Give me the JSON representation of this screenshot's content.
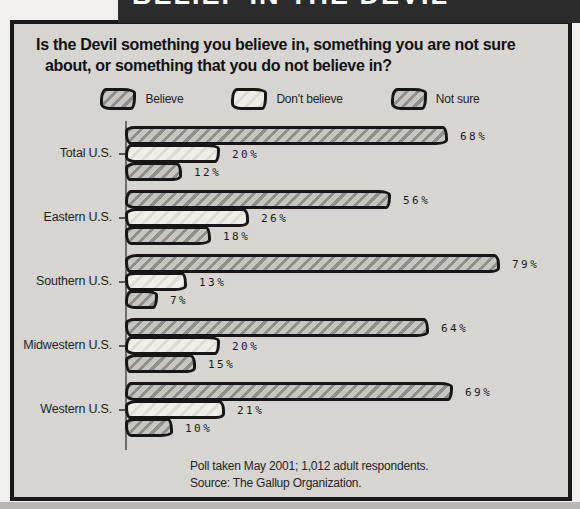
{
  "banner": {
    "title": "BELIEF IN THE DEVIL"
  },
  "question": {
    "line1": "Is the Devil something you believe in, something you are not sure",
    "line2": "about, or something that you do not believe in?"
  },
  "legend": {
    "items": [
      {
        "label": "Believe",
        "swatch": "hatch-dark"
      },
      {
        "label": "Don't believe",
        "swatch": "hatch-light"
      },
      {
        "label": "Not sure",
        "swatch": "hatch-dark"
      }
    ]
  },
  "chart_data": {
    "type": "bar",
    "orientation": "horizontal",
    "title": "BELIEF IN THE DEVIL",
    "categories": [
      "Total U.S.",
      "Eastern U.S.",
      "Southern U.S.",
      "Midwestern U.S.",
      "Western U.S."
    ],
    "series": [
      {
        "name": "Believe",
        "values": [
          68,
          56,
          79,
          64,
          69
        ]
      },
      {
        "name": "Don't believe",
        "values": [
          20,
          26,
          13,
          20,
          21
        ]
      },
      {
        "name": "Not sure",
        "values": [
          12,
          18,
          7,
          15,
          10
        ]
      }
    ],
    "value_suffix": "%",
    "xlim": [
      0,
      100
    ],
    "grid": false,
    "legend_position": "top"
  },
  "footer": {
    "line1": "Poll taken May 2001; 1,012 adult respondents.",
    "line2": "Source: The Gallup Organization."
  },
  "colors": {
    "banner_bg": "#2d2c2c",
    "panel_bg": "#d6d5d1",
    "border": "#1a1a1a",
    "hatch_dark_line": "#8f8f8c",
    "hatch_dark_base": "#c6c5c0",
    "hatch_light_line": "#dedcd4",
    "hatch_light_base": "#efede7"
  }
}
